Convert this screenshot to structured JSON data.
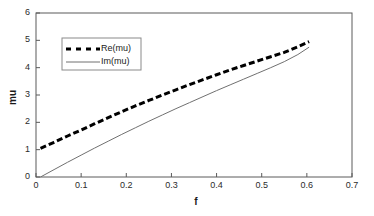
{
  "chart_data": {
    "type": "line",
    "title": "",
    "xlabel": "f",
    "ylabel": "mu",
    "xlim": [
      0,
      0.7
    ],
    "ylim": [
      0,
      6
    ],
    "xticks": [
      0,
      0.1,
      0.2,
      0.3,
      0.4,
      0.5,
      0.6,
      0.7
    ],
    "xtick_labels": [
      "0",
      "0.1",
      "0.2",
      "0.3",
      "0.4",
      "0.5",
      "0.6",
      "0.7"
    ],
    "yticks": [
      0,
      1,
      2,
      3,
      4,
      5,
      6
    ],
    "ytick_labels": [
      "0",
      "1",
      "2",
      "3",
      "4",
      "5",
      "6"
    ],
    "grid": false,
    "legend_position": "upper-left-inside",
    "frame": "box",
    "series": [
      {
        "name": "Re(mu)",
        "style": "dashed",
        "color": "#000000",
        "linewidth": 3,
        "x": [
          0.01,
          0.04,
          0.07,
          0.1,
          0.13,
          0.16,
          0.19,
          0.22,
          0.25,
          0.28,
          0.31,
          0.34,
          0.37,
          0.4,
          0.43,
          0.46,
          0.49,
          0.52,
          0.55,
          0.58,
          0.605
        ],
        "y": [
          1.05,
          1.27,
          1.5,
          1.72,
          1.95,
          2.17,
          2.39,
          2.6,
          2.8,
          3.0,
          3.19,
          3.38,
          3.56,
          3.74,
          3.92,
          4.08,
          4.24,
          4.4,
          4.56,
          4.76,
          4.95
        ]
      },
      {
        "name": "Im(mu)",
        "style": "solid",
        "color": "#707070",
        "linewidth": 1,
        "x": [
          0.01,
          0.04,
          0.07,
          0.1,
          0.13,
          0.16,
          0.19,
          0.22,
          0.25,
          0.28,
          0.31,
          0.34,
          0.37,
          0.4,
          0.43,
          0.46,
          0.49,
          0.52,
          0.55,
          0.58,
          0.605
        ],
        "y": [
          0.0,
          0.27,
          0.54,
          0.8,
          1.06,
          1.31,
          1.56,
          1.8,
          2.04,
          2.27,
          2.5,
          2.72,
          2.94,
          3.16,
          3.37,
          3.58,
          3.79,
          4.0,
          4.22,
          4.48,
          4.75
        ]
      }
    ],
    "legend": [
      {
        "label": "Re(mu)",
        "style": "dashed",
        "color": "#000000"
      },
      {
        "label": "Im(mu)",
        "style": "solid",
        "color": "#707070"
      }
    ]
  },
  "colors": {
    "axis": "#5a5a5a",
    "text": "#1a1a1a",
    "re_series": "#000000",
    "im_series": "#707070",
    "background": "#ffffff"
  }
}
